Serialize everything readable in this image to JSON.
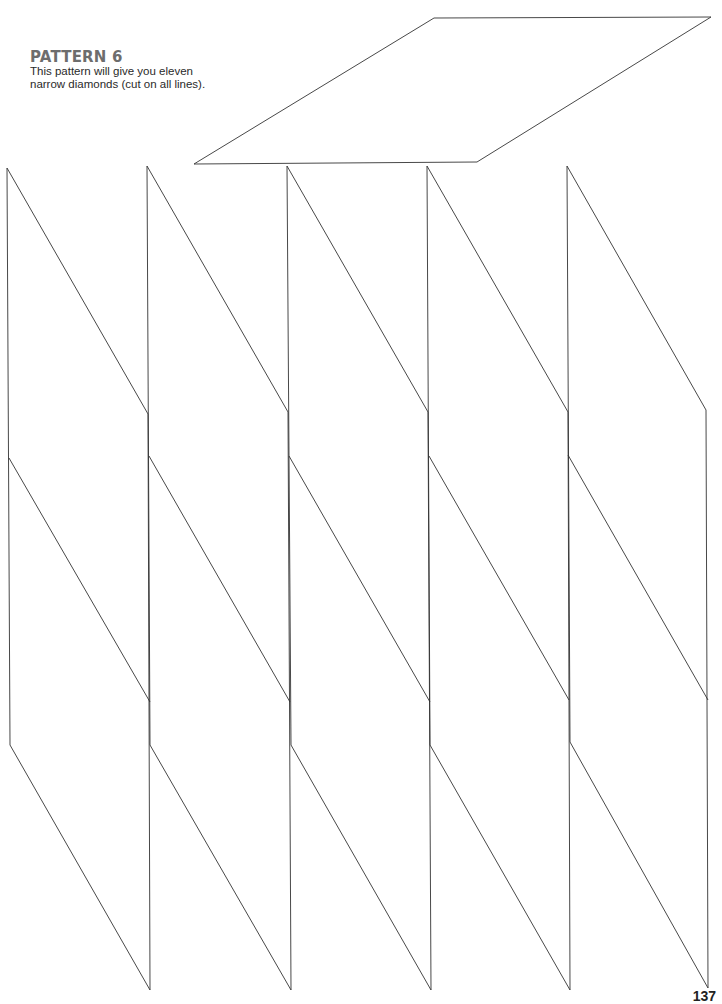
{
  "page": {
    "heading": "PATTERN 6",
    "description_line1": "This pattern will give you eleven",
    "description_line2": "narrow diamonds (cut on all lines).",
    "page_number": "137",
    "colors": {
      "heading": "#6d6d6d",
      "text": "#2a2a2a",
      "line": "#333333",
      "background": "#ffffff"
    }
  },
  "pattern": {
    "name": "narrow diamonds",
    "count": 11,
    "top_diamond": {
      "points": [
        [
          434,
          18
        ],
        [
          711,
          17
        ],
        [
          477,
          162
        ],
        [
          194,
          164
        ]
      ]
    },
    "columns": [
      {
        "left_x": 7,
        "right_x": 148
      },
      {
        "left_x": 147,
        "right_x": 288
      },
      {
        "left_x": 287,
        "right_x": 428
      },
      {
        "left_x": 427,
        "right_x": 568
      },
      {
        "left_x": 567,
        "right_x": 707
      }
    ]
  }
}
